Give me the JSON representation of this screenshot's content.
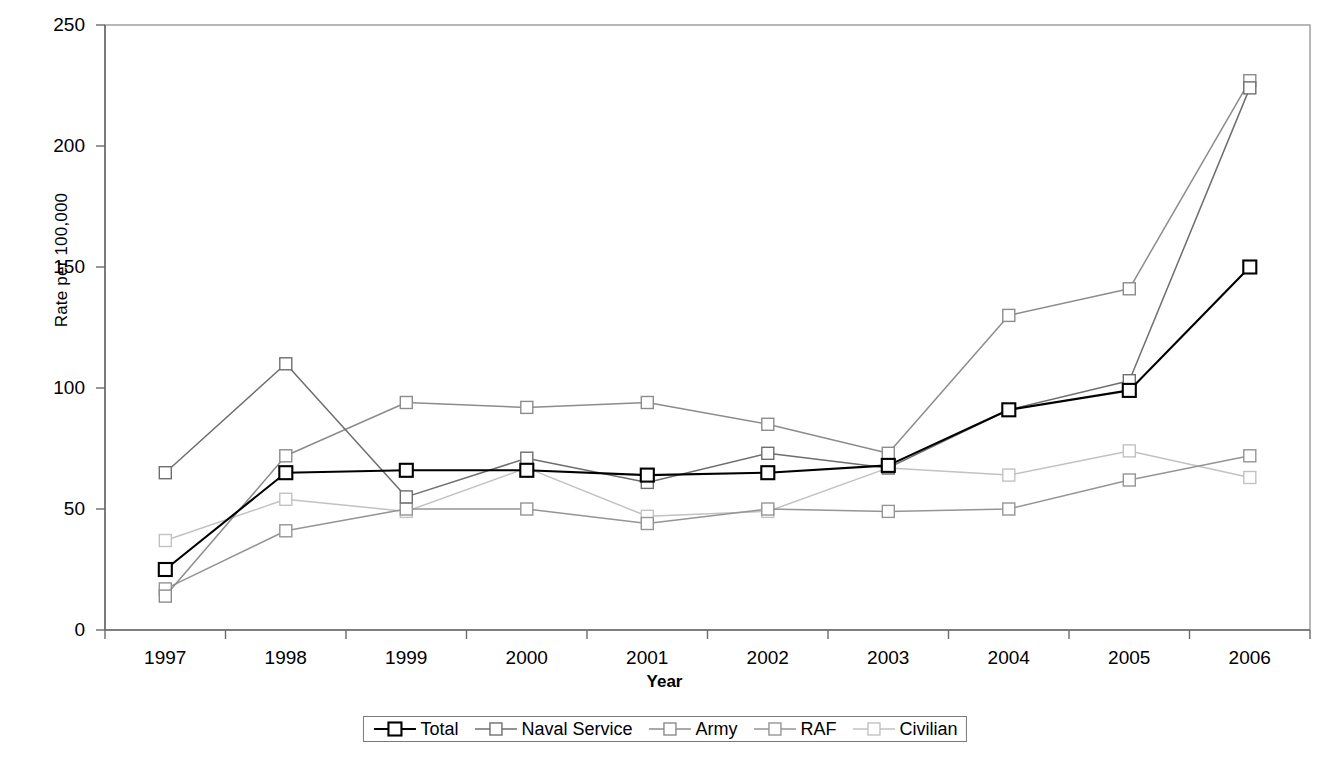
{
  "chart_data": {
    "type": "line",
    "title": "",
    "xlabel": "Year",
    "ylabel": "Rate per 100,000",
    "categories": [
      "1997",
      "1998",
      "1999",
      "2000",
      "2001",
      "2002",
      "2003",
      "2004",
      "2005",
      "2006"
    ],
    "ylim": [
      0,
      250
    ],
    "yticks": [
      0,
      50,
      100,
      150,
      200,
      250
    ],
    "grid": false,
    "legend_position": "bottom",
    "marker": "open-square",
    "series": [
      {
        "name": "Total",
        "color": "#000000",
        "values": [
          25,
          65,
          66,
          66,
          64,
          65,
          68,
          91,
          99,
          150
        ]
      },
      {
        "name": "Naval Service",
        "color": "#6e6e6e",
        "values": [
          65,
          110,
          55,
          71,
          61,
          73,
          67,
          91,
          103,
          224
        ]
      },
      {
        "name": "Army",
        "color": "#8c8c8c",
        "values": [
          14,
          72,
          94,
          92,
          94,
          85,
          73,
          130,
          141,
          227
        ]
      },
      {
        "name": "RAF",
        "color": "#959595",
        "values": [
          17,
          41,
          50,
          50,
          44,
          50,
          49,
          50,
          62,
          72
        ]
      },
      {
        "name": "Civilian",
        "color": "#c2c2c2",
        "values": [
          37,
          54,
          49,
          67,
          47,
          49,
          67,
          64,
          74,
          63
        ]
      }
    ]
  }
}
